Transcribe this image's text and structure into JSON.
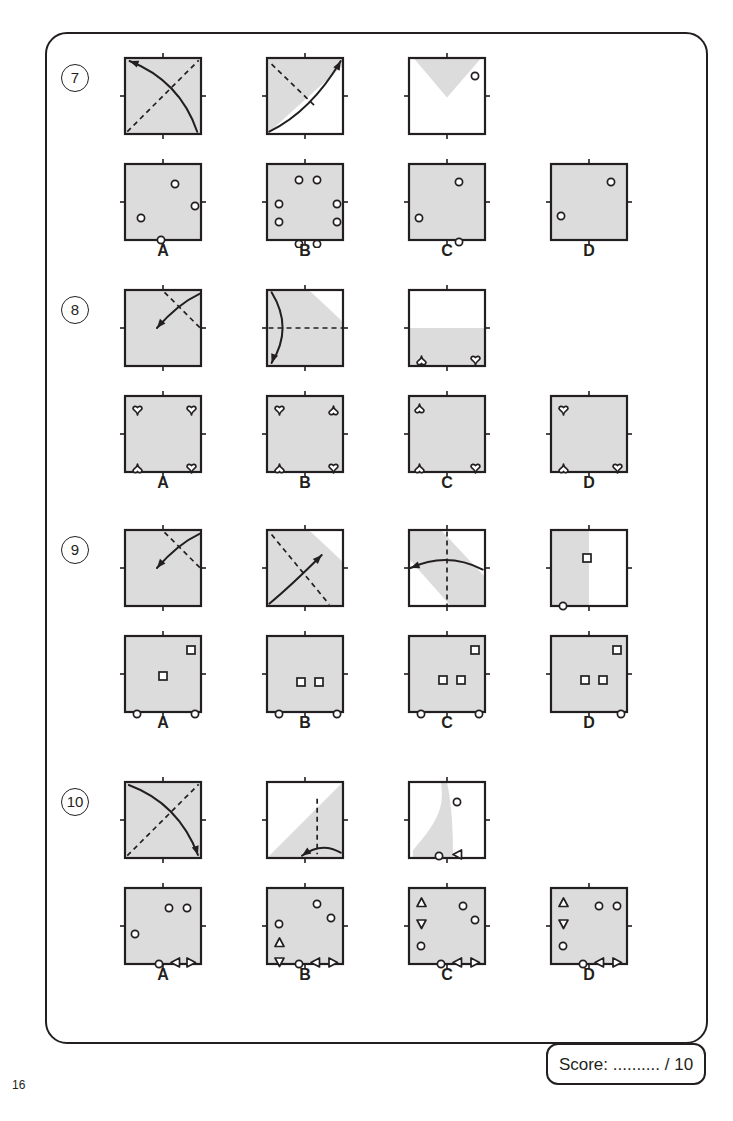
{
  "page": {
    "number": "16",
    "score_label": "Score:",
    "score_dots": "..........",
    "score_total": "/ 10",
    "fill_color": "#dcdcdc",
    "line_color": "#231f20"
  },
  "questions": [
    {
      "number": "7",
      "option_labels": [
        "A",
        "B",
        "C",
        "D"
      ],
      "prompts": [
        {
          "option": "A",
          "fold": "shaded-full",
          "dash": "diag-bl-tr",
          "arrow": "curve-br-to-tl"
        },
        {
          "option": "B",
          "fold": "lower-right-white-triangle",
          "dash": "diag-tl-br-short",
          "arrow": "curve-bl-to-tr"
        },
        {
          "option": "C",
          "fold": "top-inverted-triangle-shaded",
          "dash": "none",
          "arrow": "none",
          "marks": [
            {
              "shape": "circle",
              "x": 62,
              "y": 14
            }
          ]
        }
      ],
      "answers": [
        {
          "option": "A",
          "marks": [
            {
              "shape": "circle",
              "x": 46,
              "y": 16
            },
            {
              "shape": "circle",
              "x": 66,
              "y": 38
            },
            {
              "shape": "circle",
              "x": 12,
              "y": 50
            },
            {
              "shape": "circle",
              "x": 32,
              "y": 72
            }
          ]
        },
        {
          "option": "B",
          "marks": [
            {
              "shape": "circle",
              "x": 28,
              "y": 12
            },
            {
              "shape": "circle",
              "x": 46,
              "y": 12
            },
            {
              "shape": "circle",
              "x": 8,
              "y": 36
            },
            {
              "shape": "circle",
              "x": 8,
              "y": 54
            },
            {
              "shape": "circle",
              "x": 66,
              "y": 36
            },
            {
              "shape": "circle",
              "x": 66,
              "y": 54
            },
            {
              "shape": "circle",
              "x": 28,
              "y": 76
            },
            {
              "shape": "circle",
              "x": 46,
              "y": 76
            }
          ]
        },
        {
          "option": "C",
          "marks": [
            {
              "shape": "circle",
              "x": 46,
              "y": 14
            },
            {
              "shape": "circle",
              "x": 6,
              "y": 50
            },
            {
              "shape": "circle",
              "x": 46,
              "y": 74
            }
          ]
        },
        {
          "option": "D",
          "marks": [
            {
              "shape": "circle",
              "x": 56,
              "y": 14
            },
            {
              "shape": "circle",
              "x": 6,
              "y": 48
            }
          ]
        }
      ]
    },
    {
      "number": "8",
      "option_labels": [
        "A",
        "B",
        "C",
        "D"
      ],
      "prompts": [
        {
          "option": "A",
          "fold": "shaded-full",
          "dash": "top-to-right",
          "arrow": "curve-tr-to-center"
        },
        {
          "option": "B",
          "fold": "top-right-white-corner",
          "dash": "horizontal-mid",
          "arrow": "curve-tl-to-bl"
        },
        {
          "option": "C",
          "fold": "bottom-half-shaded",
          "dash": "none",
          "arrow": "none",
          "marks": [
            {
              "shape": "heart-down",
              "x": 8,
              "y": 66
            },
            {
              "shape": "heart-up",
              "x": 62,
              "y": 66
            }
          ]
        }
      ],
      "answers": [
        {
          "option": "A",
          "marks": [
            {
              "shape": "heart-up",
              "x": 8,
              "y": 10
            },
            {
              "shape": "heart-up",
              "x": 62,
              "y": 10
            },
            {
              "shape": "heart-down",
              "x": 8,
              "y": 68
            },
            {
              "shape": "heart-up",
              "x": 62,
              "y": 68
            }
          ]
        },
        {
          "option": "B",
          "marks": [
            {
              "shape": "heart-up",
              "x": 8,
              "y": 10
            },
            {
              "shape": "heart-down",
              "x": 62,
              "y": 10
            },
            {
              "shape": "heart-down",
              "x": 8,
              "y": 68
            },
            {
              "shape": "heart-up",
              "x": 62,
              "y": 68
            }
          ]
        },
        {
          "option": "C",
          "marks": [
            {
              "shape": "heart-down",
              "x": 6,
              "y": 8
            },
            {
              "shape": "heart-down",
              "x": 6,
              "y": 68
            },
            {
              "shape": "heart-up",
              "x": 62,
              "y": 68
            }
          ]
        },
        {
          "option": "D",
          "marks": [
            {
              "shape": "heart-up",
              "x": 8,
              "y": 10
            },
            {
              "shape": "heart-down",
              "x": 8,
              "y": 68
            },
            {
              "shape": "heart-up",
              "x": 62,
              "y": 68
            }
          ]
        }
      ]
    },
    {
      "number": "9",
      "option_labels": [
        "A",
        "B",
        "C",
        "D"
      ],
      "prompts": [
        {
          "option": "A",
          "fold": "shaded-full",
          "dash": "top-to-right",
          "arrow": "curve-tr-to-center"
        },
        {
          "option": "B",
          "fold": "top-right-white-corner",
          "dash": "diag-tl-br",
          "arrow": "curve-bl-to-center"
        },
        {
          "option": "C",
          "fold": "diagonal-band-shaded",
          "dash": "vertical-mid",
          "arrow": "curve-right-to-left"
        },
        {
          "option": "D",
          "fold": "left-half-shaded",
          "dash": "none",
          "arrow": "none",
          "marks": [
            {
              "shape": "square",
              "x": 32,
              "y": 24
            },
            {
              "shape": "circle",
              "x": 8,
              "y": 72
            }
          ]
        }
      ],
      "answers": [
        {
          "option": "A",
          "marks": [
            {
              "shape": "square",
              "x": 62,
              "y": 10
            },
            {
              "shape": "square",
              "x": 34,
              "y": 36
            },
            {
              "shape": "circle",
              "x": 8,
              "y": 74
            },
            {
              "shape": "circle",
              "x": 66,
              "y": 74
            }
          ]
        },
        {
          "option": "B",
          "marks": [
            {
              "shape": "square",
              "x": 30,
              "y": 42
            },
            {
              "shape": "square",
              "x": 48,
              "y": 42
            },
            {
              "shape": "circle",
              "x": 8,
              "y": 74
            },
            {
              "shape": "circle",
              "x": 66,
              "y": 74
            }
          ]
        },
        {
          "option": "C",
          "marks": [
            {
              "shape": "square",
              "x": 62,
              "y": 10
            },
            {
              "shape": "square",
              "x": 30,
              "y": 40
            },
            {
              "shape": "square",
              "x": 48,
              "y": 40
            },
            {
              "shape": "circle",
              "x": 8,
              "y": 74
            },
            {
              "shape": "circle",
              "x": 66,
              "y": 74
            }
          ]
        },
        {
          "option": "D",
          "marks": [
            {
              "shape": "square",
              "x": 62,
              "y": 10
            },
            {
              "shape": "square",
              "x": 30,
              "y": 40
            },
            {
              "shape": "square",
              "x": 48,
              "y": 40
            },
            {
              "shape": "circle",
              "x": 66,
              "y": 74
            }
          ]
        }
      ]
    },
    {
      "number": "10",
      "option_labels": [
        "A",
        "B",
        "C",
        "D"
      ],
      "prompts": [
        {
          "option": "A",
          "fold": "shaded-full",
          "dash": "diag-bl-tr",
          "arrow": "curve-tl-to-br"
        },
        {
          "option": "B",
          "fold": "upper-left-white-triangle",
          "dash": "vertical-right",
          "arrow": "curve-bottom-small"
        },
        {
          "option": "C",
          "fold": "curved-sliver-shaded",
          "dash": "none",
          "arrow": "none",
          "marks": [
            {
              "shape": "circle",
              "x": 44,
              "y": 16
            },
            {
              "shape": "circle",
              "x": 26,
              "y": 70
            },
            {
              "shape": "triangle-left",
              "x": 44,
              "y": 68
            }
          ]
        }
      ],
      "answers": [
        {
          "option": "A",
          "marks": [
            {
              "shape": "circle",
              "x": 40,
              "y": 16
            },
            {
              "shape": "circle",
              "x": 58,
              "y": 16
            },
            {
              "shape": "circle",
              "x": 6,
              "y": 42
            },
            {
              "shape": "circle",
              "x": 30,
              "y": 72
            },
            {
              "shape": "triangle-left",
              "x": 46,
              "y": 70
            },
            {
              "shape": "triangle-right",
              "x": 62,
              "y": 70
            }
          ]
        },
        {
          "option": "B",
          "marks": [
            {
              "shape": "circle",
              "x": 46,
              "y": 12
            },
            {
              "shape": "circle",
              "x": 60,
              "y": 26
            },
            {
              "shape": "circle",
              "x": 8,
              "y": 32
            },
            {
              "shape": "triangle-up",
              "x": 8,
              "y": 50
            },
            {
              "shape": "triangle-down",
              "x": 8,
              "y": 70
            },
            {
              "shape": "circle",
              "x": 28,
              "y": 72
            },
            {
              "shape": "triangle-left",
              "x": 44,
              "y": 70
            },
            {
              "shape": "triangle-right",
              "x": 62,
              "y": 70
            }
          ]
        },
        {
          "option": "C",
          "marks": [
            {
              "shape": "triangle-up",
              "x": 8,
              "y": 10
            },
            {
              "shape": "triangle-down",
              "x": 8,
              "y": 32
            },
            {
              "shape": "circle",
              "x": 8,
              "y": 54
            },
            {
              "shape": "circle",
              "x": 50,
              "y": 14
            },
            {
              "shape": "circle",
              "x": 62,
              "y": 28
            },
            {
              "shape": "circle",
              "x": 28,
              "y": 72
            },
            {
              "shape": "triangle-left",
              "x": 44,
              "y": 70
            },
            {
              "shape": "triangle-right",
              "x": 62,
              "y": 70
            }
          ]
        },
        {
          "option": "D",
          "marks": [
            {
              "shape": "triangle-up",
              "x": 8,
              "y": 10
            },
            {
              "shape": "triangle-down",
              "x": 8,
              "y": 32
            },
            {
              "shape": "circle",
              "x": 8,
              "y": 54
            },
            {
              "shape": "circle",
              "x": 44,
              "y": 14
            },
            {
              "shape": "circle",
              "x": 62,
              "y": 14
            },
            {
              "shape": "circle",
              "x": 28,
              "y": 72
            },
            {
              "shape": "triangle-left",
              "x": 44,
              "y": 70
            },
            {
              "shape": "triangle-right",
              "x": 62,
              "y": 70
            }
          ]
        }
      ]
    }
  ]
}
